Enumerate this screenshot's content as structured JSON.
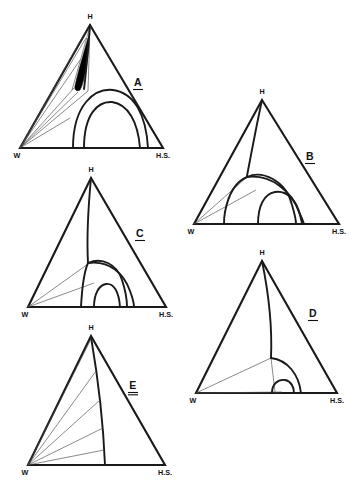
{
  "figure": {
    "type": "ternary-phase-diagram-set",
    "panel_count": 5,
    "background_color": "#ffffff",
    "line_color": "#1a1a1a",
    "tie_line_color": "#4a4a4a",
    "solid_fill_color": "#000000"
  },
  "vertex_labels": {
    "apex": "H",
    "left": "W",
    "right": "H.S."
  },
  "panels": [
    {
      "id": "A",
      "label": "A",
      "apex_label": "H",
      "left_label": "W",
      "right_label": "H.S.",
      "label_x": 138,
      "label_y": 86,
      "description": "Ternary diagram with narrow dark solid field near apex, two broad nested arcs and a fan of tie lines from W"
    },
    {
      "id": "B",
      "label": "B",
      "apex_label": "H",
      "left_label": "W",
      "right_label": "H.S.",
      "label_x": 310,
      "label_y": 160,
      "description": "Ternary diagram with two nested dome arcs and two tie lines from W"
    },
    {
      "id": "C",
      "label": "C",
      "apex_label": "H",
      "left_label": "W",
      "right_label": "H.S.",
      "label_x": 140,
      "label_y": 237,
      "description": "Ternary diagram with a curved boundary from apex, two nested dome arcs and two tie lines from W"
    },
    {
      "id": "D",
      "label": "D",
      "apex_label": "H",
      "left_label": "W",
      "right_label": "H.S.",
      "label_x": 313,
      "label_y": 317,
      "description": "Ternary diagram with a near-vertical curve from apex, one large quarter arc and a small semicircle on the base"
    },
    {
      "id": "E",
      "label": "E",
      "apex_label": "H",
      "left_label": "W",
      "right_label": "H.S.",
      "label_x": 133,
      "label_y": 389,
      "description": "Ternary diagram with a curved boundary from apex to base and five radiating tie lines from W"
    }
  ]
}
